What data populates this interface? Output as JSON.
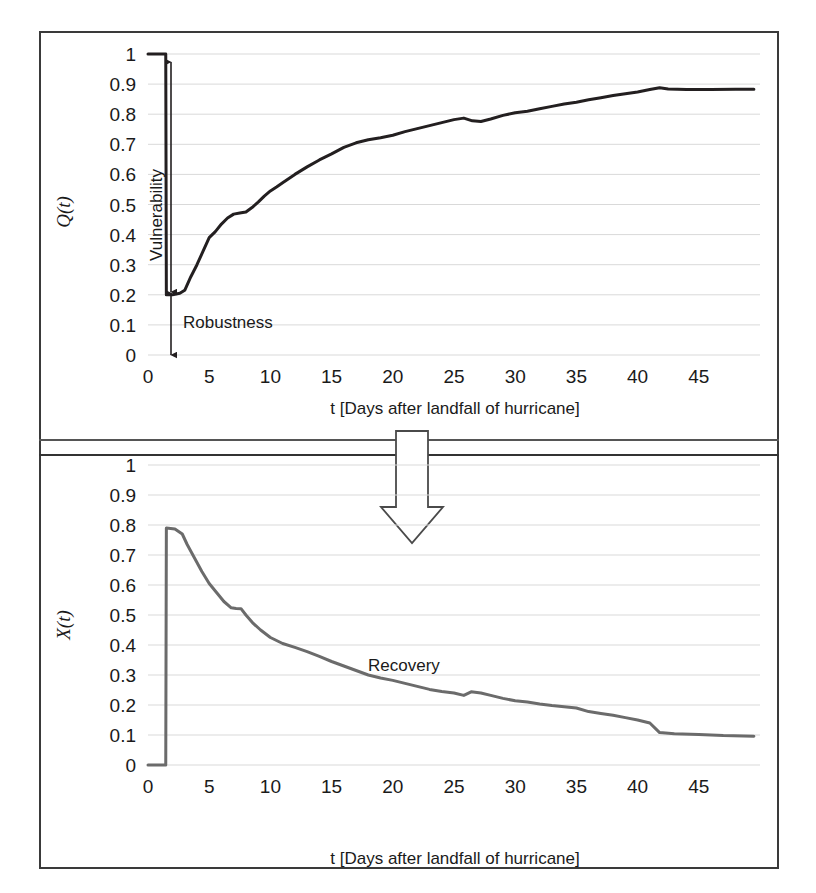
{
  "figure": {
    "panels": [
      "top",
      "bottom"
    ],
    "transition_arrow": "down-arrow-icon",
    "frame_color": "#3a3a3a",
    "background": "#ffffff"
  },
  "chart_data": [
    {
      "id": "quality-recovery-chart",
      "type": "line",
      "title": "",
      "xlabel": "t [Days after landfall of hurricane]",
      "ylabel": "Q(t)",
      "xlim": [
        0,
        50
      ],
      "ylim": [
        0,
        1
      ],
      "grid": true,
      "grid_axis": "y",
      "xticks": [
        0,
        5,
        10,
        15,
        20,
        25,
        30,
        35,
        40,
        45
      ],
      "xticklabels": [
        "0",
        "5",
        "10",
        "15",
        "20",
        "25",
        "30",
        "35",
        "40",
        "45"
      ],
      "yticks": [
        0,
        0.1,
        0.2,
        0.3,
        0.4,
        0.5,
        0.6,
        0.7,
        0.8,
        0.9,
        1
      ],
      "yticklabels": [
        "0",
        "0.1",
        "0.2",
        "0.3",
        "0.4",
        "0.5",
        "0.6",
        "0.7",
        "0.8",
        "0.9",
        "1"
      ],
      "line_color": "#231f20",
      "line_width": 3,
      "series": [
        {
          "name": "Q(t)",
          "x": [
            0,
            1.0,
            1.45,
            1.5,
            2.0,
            2.6,
            3.0,
            3.5,
            4.0,
            4.5,
            5.0,
            5.5,
            6.0,
            6.5,
            7.0,
            7.5,
            8.0,
            8.5,
            9.0,
            9.5,
            10.0,
            10.5,
            11.0,
            12.0,
            13.0,
            14.0,
            15.0,
            16.0,
            17.0,
            18.0,
            19.0,
            20.0,
            21.0,
            22.0,
            23.0,
            24.0,
            25.0,
            25.8,
            26.5,
            27.2,
            28.0,
            29.0,
            30.0,
            31.0,
            32.0,
            33.0,
            34.0,
            35.0,
            36.0,
            37.0,
            38.0,
            39.0,
            40.0,
            41.0,
            41.8,
            42.5,
            44.0,
            46.0,
            48.0,
            49.5
          ],
          "y": [
            1.0,
            1.0,
            1.0,
            0.2,
            0.2,
            0.205,
            0.215,
            0.26,
            0.3,
            0.345,
            0.39,
            0.41,
            0.435,
            0.455,
            0.468,
            0.472,
            0.475,
            0.49,
            0.508,
            0.528,
            0.545,
            0.558,
            0.572,
            0.6,
            0.625,
            0.648,
            0.668,
            0.69,
            0.705,
            0.715,
            0.722,
            0.73,
            0.742,
            0.752,
            0.762,
            0.772,
            0.782,
            0.787,
            0.778,
            0.776,
            0.784,
            0.796,
            0.805,
            0.81,
            0.818,
            0.826,
            0.834,
            0.84,
            0.848,
            0.855,
            0.862,
            0.868,
            0.874,
            0.882,
            0.888,
            0.884,
            0.882,
            0.882,
            0.883,
            0.883
          ]
        }
      ],
      "annotations": [
        {
          "name": "vulnerability",
          "label": "Vulnerability",
          "type": "double-arrow-vertical",
          "from_y": 1.0,
          "to_y": 0.32,
          "at_x": 1.5
        },
        {
          "name": "robustness",
          "label": "Robustness",
          "type": "double-arrow-vertical",
          "from_y": 0.2,
          "to_y": 0.0,
          "at_x": 1.5
        }
      ]
    },
    {
      "id": "loss-decay-chart",
      "type": "line",
      "title": "",
      "xlabel": "t [Days after landfall of hurricane]",
      "ylabel": "X(t)",
      "xlim": [
        0,
        50
      ],
      "ylim": [
        0,
        1
      ],
      "grid": true,
      "grid_axis": "y",
      "xticks": [
        0,
        5,
        10,
        15,
        20,
        25,
        30,
        35,
        40,
        45
      ],
      "xticklabels": [
        "0",
        "5",
        "10",
        "15",
        "20",
        "25",
        "30",
        "35",
        "40",
        "45"
      ],
      "yticks": [
        0,
        0.1,
        0.2,
        0.3,
        0.4,
        0.5,
        0.6,
        0.7,
        0.8,
        0.9,
        1
      ],
      "yticklabels": [
        "0",
        "0.1",
        "0.2",
        "0.3",
        "0.4",
        "0.5",
        "0.6",
        "0.7",
        "0.8",
        "0.9",
        "1"
      ],
      "line_color": "#6b6b6b",
      "line_width": 3,
      "series": [
        {
          "name": "X(t)",
          "x": [
            0,
            1.0,
            1.45,
            1.5,
            2.2,
            2.8,
            3.2,
            3.8,
            4.4,
            5.0,
            5.6,
            6.2,
            6.8,
            7.2,
            7.6,
            8.0,
            8.6,
            9.2,
            10.0,
            11.0,
            12.0,
            13.0,
            14.0,
            15.0,
            16.0,
            17.0,
            18.0,
            19.0,
            20.0,
            21.0,
            22.0,
            23.0,
            24.0,
            25.0,
            25.8,
            26.4,
            27.2,
            28.0,
            29.0,
            30.0,
            31.0,
            32.0,
            33.0,
            34.0,
            35.0,
            36.0,
            37.0,
            38.0,
            39.0,
            40.0,
            41.0,
            41.8,
            43.0,
            45.0,
            47.0,
            49.5
          ],
          "y": [
            0.0,
            0.0,
            0.0,
            0.79,
            0.787,
            0.77,
            0.735,
            0.69,
            0.645,
            0.605,
            0.575,
            0.545,
            0.524,
            0.522,
            0.521,
            0.5,
            0.472,
            0.45,
            0.425,
            0.405,
            0.392,
            0.378,
            0.362,
            0.345,
            0.33,
            0.315,
            0.3,
            0.29,
            0.282,
            0.272,
            0.262,
            0.252,
            0.245,
            0.24,
            0.232,
            0.244,
            0.24,
            0.232,
            0.222,
            0.214,
            0.21,
            0.203,
            0.198,
            0.194,
            0.19,
            0.178,
            0.172,
            0.166,
            0.158,
            0.15,
            0.14,
            0.108,
            0.104,
            0.102,
            0.098,
            0.096
          ]
        }
      ],
      "annotations": [
        {
          "name": "recovery",
          "label": "Recovery",
          "type": "text",
          "at_x": 21.5,
          "at_y": 0.325
        }
      ]
    }
  ]
}
